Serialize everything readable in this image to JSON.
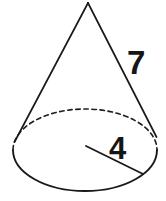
{
  "figure": {
    "kind": "cone-diagram",
    "background_color": "#ffffff",
    "stroke_color": "#1a1a1a",
    "label_color": "#161616",
    "width": 166,
    "height": 201
  },
  "labels": {
    "slant_height": "7",
    "radius": "4"
  },
  "geometry": {
    "apex": {
      "x": 88,
      "y": 2
    },
    "base_ellipse": {
      "cx": 85,
      "cy": 150,
      "rx": 72,
      "ry": 41
    },
    "left_slant": {
      "x1": 88,
      "y1": 2,
      "x2": 14,
      "y2": 143
    },
    "right_slant": {
      "x1": 88,
      "y1": 2,
      "x2": 156,
      "y2": 137
    },
    "radius_line": {
      "x1": 86,
      "y1": 146,
      "x2": 143,
      "y2": 174
    },
    "hidden_arc_style": "dashed",
    "visible_arc_style": "solid"
  }
}
